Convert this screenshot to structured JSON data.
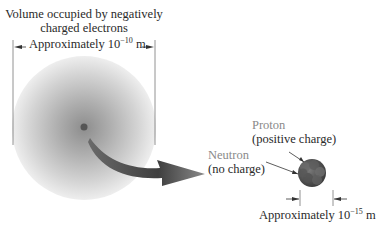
{
  "diagram": {
    "atom": {
      "label_line1": "Volume occupied by negatively",
      "label_line2": "charged electrons",
      "dimension_prefix": "Approximately 10",
      "dimension_exponent": "−10",
      "dimension_unit": "m"
    },
    "proton": {
      "name": "Proton",
      "charge": "(positive charge)"
    },
    "neutron": {
      "name": "Neutron",
      "charge": "(no charge)"
    },
    "nucleus": {
      "dimension_prefix": "Approximately 10",
      "dimension_exponent": "−15",
      "dimension_unit": "m"
    },
    "colors": {
      "electron_cloud": "#9a9a9a",
      "nucleus": "#5a5a5a",
      "arrow": "#4a4a4a",
      "label_grey": "#8a8a8a",
      "label_dark": "#2a2a2a"
    }
  }
}
